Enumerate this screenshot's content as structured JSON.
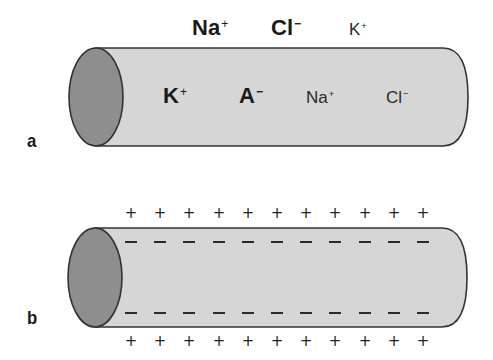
{
  "colors": {
    "cylinder_body": "#d6d6d6",
    "cylinder_cap": "#8e8e8e",
    "outline": "#333333",
    "text": "#1a1a1a"
  },
  "panels": [
    {
      "label": "a",
      "outside_ions": [
        {
          "symbol": "Na",
          "charge": "+",
          "weight": "bold"
        },
        {
          "symbol": "Cl",
          "charge": "−",
          "weight": "bold"
        },
        {
          "symbol": "K",
          "charge": "+",
          "weight": "regular"
        }
      ],
      "inside_ions": [
        {
          "symbol": "K",
          "charge": "+",
          "weight": "bold"
        },
        {
          "symbol": "A",
          "charge": "−",
          "weight": "bold"
        },
        {
          "symbol": "Na",
          "charge": "+",
          "weight": "regular"
        },
        {
          "symbol": "Cl",
          "charge": "−",
          "weight": "regular"
        }
      ]
    },
    {
      "label": "b",
      "outside_charge_symbol": "+",
      "inside_charge_symbol": "−",
      "charges_per_row": 11,
      "rows": [
        "outside-top: +",
        "inside-top: −",
        "inside-bottom: −",
        "outside-bottom: +"
      ]
    }
  ]
}
